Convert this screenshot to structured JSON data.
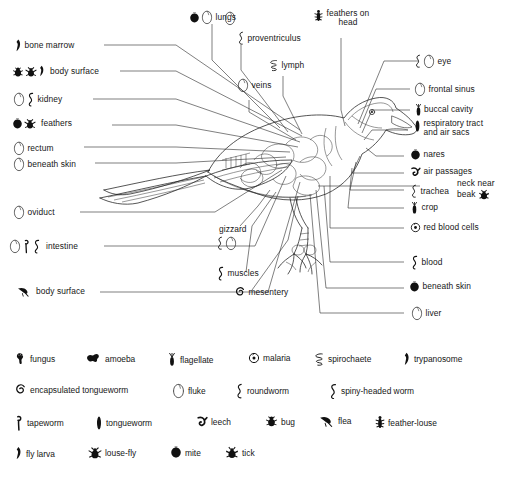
{
  "left_labels": [
    {
      "text": "bone marrow",
      "icons": [
        "trypanosome"
      ]
    },
    {
      "text": "body  surface",
      "icons": [
        "bug",
        "louse-fly",
        "fly-larva"
      ]
    },
    {
      "text": "kidney",
      "icons": [
        "fluke",
        "spiny-headed-worm"
      ]
    },
    {
      "text": "feathers",
      "icons": [
        "mite",
        "louse-fly"
      ]
    },
    {
      "text": "rectum",
      "icons": [
        "fluke"
      ]
    },
    {
      "text": "beneath skin",
      "icons": [
        "fluke"
      ]
    },
    {
      "text": "oviduct",
      "icons": [
        "fluke"
      ]
    },
    {
      "text": "intestine",
      "icons": [
        "fluke",
        "tapeworm",
        "spiny-headed-worm"
      ]
    },
    {
      "text": "body surface",
      "icons": [
        "flea"
      ]
    }
  ],
  "top_labels": [
    {
      "text": "lungs",
      "icons": [
        "mite",
        "fluke"
      ]
    },
    {
      "text": "proventriculus",
      "icons": [
        "fluke",
        "roundworm"
      ]
    },
    {
      "text": "lymph",
      "icons": [
        "spirochaete"
      ]
    },
    {
      "text": "veins",
      "icons": [
        "fluke"
      ]
    },
    {
      "text": "feathers on",
      "text2": "head",
      "icons": [
        "feather-louse"
      ]
    }
  ],
  "center_labels": [
    {
      "text": "gizzard",
      "icons": [
        "roundworm",
        "fluke"
      ]
    },
    {
      "text": "muscles",
      "icons": [
        "spiny-headed-worm"
      ]
    },
    {
      "text": "mesentery",
      "icons": [
        "encapsulated-tongueworm"
      ]
    }
  ],
  "right_labels": [
    {
      "text": "eye",
      "icons": [
        "roundworm",
        "fluke"
      ]
    },
    {
      "text": "frontal  sinus",
      "icons": [
        "fluke"
      ]
    },
    {
      "text": "buccal cavity",
      "icons": [
        "flagellate"
      ]
    },
    {
      "text": "respiratory  tract",
      "text2": "and  air  sacs",
      "icons": [
        "tongueworm"
      ]
    },
    {
      "text": "nares",
      "icons": [
        "mite"
      ]
    },
    {
      "text": "air passages",
      "icons": [
        "leech"
      ]
    },
    {
      "text": "trachea",
      "icons": [
        "roundworm"
      ]
    },
    {
      "text": "crop",
      "icons": [
        "flagellate"
      ]
    },
    {
      "text": "red blood cells",
      "icons": [
        "malaria"
      ]
    },
    {
      "text": "blood",
      "icons": [
        "spiny-headed-worm"
      ]
    },
    {
      "text": "beneath skin",
      "icons": [
        "mite"
      ]
    },
    {
      "text": "liver",
      "icons": [
        "fluke"
      ]
    }
  ],
  "inline_labels": [
    {
      "text": "neck near"
    },
    {
      "text": "beak",
      "icons": [
        "tick"
      ]
    }
  ],
  "legend": {
    "rows": [
      [
        {
          "text": "fungus",
          "icon": "fungus"
        },
        {
          "text": "amoeba",
          "icon": "amoeba"
        },
        {
          "text": "flagellate",
          "icon": "flagellate"
        },
        {
          "text": "malaria",
          "icon": "malaria"
        },
        {
          "text": "spirochaete",
          "icon": "spirochaete"
        },
        {
          "text": "trypanosome",
          "icon": "trypanosome"
        }
      ],
      [
        {
          "text": "encapsulated tongueworm",
          "icon": "encapsulated-tongueworm"
        },
        {
          "text": "fluke",
          "icon": "fluke"
        },
        {
          "text": "roundworm",
          "icon": "roundworm"
        },
        {
          "text": "spiny-headed worm",
          "icon": "spiny-headed-worm"
        }
      ],
      [
        {
          "text": "tapeworm",
          "icon": "tapeworm"
        },
        {
          "text": "tongueworm",
          "icon": "tongueworm"
        },
        {
          "text": "leech",
          "icon": "leech"
        },
        {
          "text": "bug",
          "icon": "bug"
        },
        {
          "text": "flea",
          "icon": "flea"
        },
        {
          "text": "feather-louse",
          "icon": "feather-louse"
        }
      ],
      [
        {
          "text": "fly  larva",
          "icon": "fly-larva"
        },
        {
          "text": "louse-fly",
          "icon": "louse-fly"
        },
        {
          "text": "mite",
          "icon": "mite"
        },
        {
          "text": "tick",
          "icon": "tick"
        }
      ]
    ]
  },
  "colors": {
    "ink": "#1a1a1a",
    "line": "#2a2a2a",
    "background": "#ffffff"
  }
}
